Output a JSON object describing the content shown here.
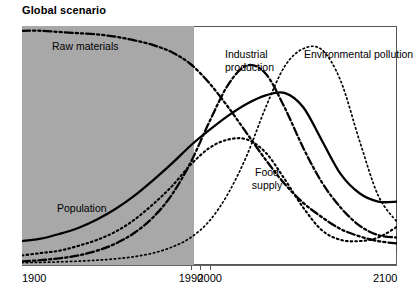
{
  "chart": {
    "title": "Global scenario"
  },
  "axis": {
    "x_ticks": [
      {
        "label": "1900",
        "value": 1900
      },
      {
        "label": "1990",
        "value": 1990
      },
      {
        "label": "2000",
        "value": 2000
      },
      {
        "label": "2100",
        "value": 2100
      }
    ],
    "x_tick_marks": [
      1990,
      1995,
      2000
    ]
  },
  "labels": {
    "raw_materials": "Raw materials",
    "population": "Population",
    "food_supply_line1": "Food",
    "food_supply_line2": "supply",
    "industrial_line1": "Industrial",
    "industrial_line2": "production",
    "pollution": "Environmental pollution"
  },
  "colors": {
    "shaded_region": "#a8a8a8",
    "curve": "#000000",
    "frame": "#555555",
    "background": "#ffffff"
  },
  "chart_data": {
    "type": "line",
    "title": "Global scenario",
    "xlabel": "",
    "ylabel": "",
    "xlim": [
      1900,
      2100
    ],
    "ylim": [
      0,
      1
    ],
    "grid": false,
    "legend": "inline-annotations",
    "shaded_region": {
      "from": 1900,
      "to": 1992,
      "meaning": "historical data period",
      "color": "#a8a8a8"
    },
    "x_tick_labels": [
      "1900",
      "1990",
      "2000",
      "2100"
    ],
    "series": [
      {
        "name": "Raw materials",
        "style": "dash-dot-dot",
        "linewidth": "thick",
        "x": [
          1900,
          1910,
          1920,
          1930,
          1940,
          1950,
          1960,
          1970,
          1980,
          1990,
          2000,
          2010,
          2020,
          2030,
          2040,
          2050,
          2060,
          2070,
          2080,
          2090,
          2100
        ],
        "y": [
          0.98,
          0.98,
          0.975,
          0.97,
          0.965,
          0.955,
          0.94,
          0.92,
          0.89,
          0.84,
          0.76,
          0.66,
          0.55,
          0.44,
          0.34,
          0.26,
          0.2,
          0.15,
          0.12,
          0.1,
          0.09
        ]
      },
      {
        "name": "Population",
        "style": "solid",
        "linewidth": "thick",
        "x": [
          1900,
          1910,
          1920,
          1930,
          1940,
          1950,
          1960,
          1970,
          1980,
          1990,
          2000,
          2010,
          2020,
          2030,
          2040,
          2050,
          2060,
          2070,
          2080,
          2090,
          2100
        ],
        "y": [
          0.1,
          0.11,
          0.13,
          0.155,
          0.19,
          0.235,
          0.29,
          0.355,
          0.425,
          0.5,
          0.565,
          0.625,
          0.675,
          0.71,
          0.72,
          0.66,
          0.52,
          0.38,
          0.3,
          0.265,
          0.265
        ]
      },
      {
        "name": "Food supply",
        "style": "dotted",
        "linewidth": "medium",
        "x": [
          1900,
          1910,
          1920,
          1930,
          1940,
          1950,
          1960,
          1970,
          1980,
          1990,
          2000,
          2010,
          2020,
          2030,
          2040,
          2050,
          2060,
          2070,
          2080,
          2090,
          2100
        ],
        "y": [
          0.04,
          0.05,
          0.06,
          0.08,
          0.105,
          0.14,
          0.19,
          0.255,
          0.33,
          0.42,
          0.49,
          0.525,
          0.525,
          0.47,
          0.36,
          0.24,
          0.145,
          0.105,
          0.1,
          0.115,
          0.16
        ]
      },
      {
        "name": "Industrial production",
        "style": "dash-dot",
        "linewidth": "thick",
        "x": [
          1900,
          1910,
          1920,
          1930,
          1940,
          1950,
          1960,
          1970,
          1980,
          1990,
          2000,
          2010,
          2020,
          2030,
          2040,
          2050,
          2060,
          2070,
          2080,
          2090,
          2100
        ],
        "y": [
          0.015,
          0.02,
          0.028,
          0.04,
          0.06,
          0.09,
          0.135,
          0.2,
          0.295,
          0.43,
          0.6,
          0.755,
          0.835,
          0.8,
          0.66,
          0.49,
          0.345,
          0.24,
          0.165,
          0.125,
          0.115
        ]
      },
      {
        "name": "Environmental pollution",
        "style": "fine-dotted",
        "linewidth": "thin",
        "x": [
          1900,
          1910,
          1920,
          1930,
          1940,
          1950,
          1960,
          1970,
          1980,
          1990,
          2000,
          2010,
          2020,
          2030,
          2040,
          2050,
          2060,
          2070,
          2080,
          2090,
          2100
        ],
        "y": [
          0.01,
          0.011,
          0.013,
          0.016,
          0.02,
          0.026,
          0.035,
          0.05,
          0.075,
          0.115,
          0.185,
          0.3,
          0.46,
          0.66,
          0.83,
          0.905,
          0.9,
          0.77,
          0.52,
          0.29,
          0.18
        ]
      }
    ]
  }
}
